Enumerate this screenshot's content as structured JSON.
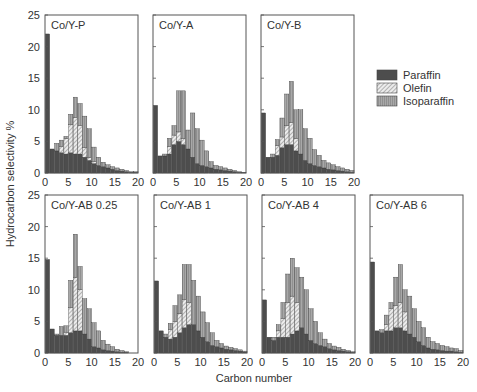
{
  "chart_data": {
    "type": "bar",
    "stacked": true,
    "ylabel": "Hydrocarbon selectivity %",
    "xlabel": "Carbon number",
    "ylim": [
      0,
      25
    ],
    "xlim": [
      0,
      20
    ],
    "yticks": [
      0,
      5,
      10,
      15,
      20,
      25
    ],
    "xticks": [
      0,
      5,
      10,
      15,
      20
    ],
    "legend": {
      "position": "right",
      "entries": [
        {
          "name": "Paraffin",
          "color": "#4d4d4d",
          "pattern": "solid"
        },
        {
          "name": "Olefin",
          "color": "#d6d6d6",
          "pattern": "hatched"
        },
        {
          "name": "Isoparaffin",
          "color": "#9a9a9a",
          "pattern": "vertical-lines"
        }
      ]
    },
    "categories": [
      1,
      2,
      3,
      4,
      5,
      6,
      7,
      8,
      9,
      10,
      11,
      12,
      13,
      14,
      15,
      16,
      17,
      18,
      19,
      20
    ],
    "panels": [
      {
        "title": "Co/Y-P",
        "series": [
          {
            "name": "Paraffin",
            "values": [
              22,
              3.8,
              3.5,
              3.2,
              3.0,
              3.2,
              3.0,
              3.0,
              2.5,
              2.0,
              1.5,
              1.2,
              1.0,
              0.8,
              0.6,
              0.4,
              0.3,
              0.2,
              0.1,
              0.1
            ]
          },
          {
            "name": "Olefin",
            "values": [
              0,
              0,
              0,
              1.0,
              2.5,
              4.5,
              5.8,
              4.5,
              1.5,
              0.5,
              0.3,
              0,
              0,
              0,
              0,
              0,
              0,
              0,
              0,
              0
            ]
          },
          {
            "name": "Isoparaffin",
            "values": [
              0,
              0,
              1.2,
              1.0,
              0.3,
              1.6,
              3.2,
              3.5,
              5.0,
              4.5,
              2.3,
              1.3,
              0.7,
              0.5,
              0.4,
              0.4,
              0.3,
              0.2,
              0.1,
              0.1
            ]
          }
        ],
        "totals": [
          22,
          3.8,
          4.7,
          5.2,
          5.8,
          9.3,
          12,
          11,
          9,
          7,
          4.1,
          2.5,
          1.7,
          1.3,
          1.0,
          0.8,
          0.6,
          0.4,
          0.2,
          0.2
        ]
      },
      {
        "title": "Co/Y-A",
        "series": [
          {
            "name": "Paraffin",
            "values": [
              10.7,
              2.7,
              2.7,
              3.0,
              4.5,
              5.0,
              4.5,
              3.8,
              2.5,
              1.5,
              1.2,
              1.0,
              0.8,
              0.6,
              0.5,
              0.4,
              0.3,
              0.2,
              0.1,
              0.1
            ]
          },
          {
            "name": "Olefin",
            "values": [
              0,
              0,
              0,
              1.2,
              1.5,
              1.5,
              1.0,
              0,
              0,
              0,
              0,
              0,
              0,
              0,
              0,
              0,
              0,
              0,
              0,
              0
            ]
          },
          {
            "name": "Isoparaffin",
            "values": [
              0,
              0,
              0.3,
              1.3,
              1.5,
              6.5,
              7.5,
              3.0,
              7.0,
              5.5,
              4.0,
              2.5,
              1.0,
              0.6,
              0.5,
              0.4,
              0.3,
              0.2,
              0.1,
              0
            ]
          }
        ],
        "totals": [
          10.7,
          2.7,
          3.0,
          5.5,
          7.5,
          13,
          13,
          7.0,
          9.5,
          7.0,
          5.2,
          3.5,
          1.8,
          1.2,
          1.0,
          0.8,
          0.6,
          0.4,
          0.2,
          0.1
        ]
      },
      {
        "title": "Co/Y-B",
        "series": [
          {
            "name": "Paraffin",
            "values": [
              9.5,
              2.5,
              2.5,
              2.8,
              4.0,
              4.5,
              4.5,
              3.5,
              3.0,
              2.0,
              1.5,
              1.2,
              1.0,
              0.8,
              0.6,
              0.5,
              0.4,
              0.3,
              0.2,
              0.1
            ]
          },
          {
            "name": "Olefin",
            "values": [
              0,
              0,
              0,
              1.5,
              1.7,
              3.0,
              3.5,
              2.0,
              0,
              0,
              0,
              0,
              0,
              0,
              0,
              0,
              0,
              0,
              0,
              0
            ]
          },
          {
            "name": "Isoparaffin",
            "values": [
              0,
              0,
              0.5,
              1.0,
              3.0,
              5.0,
              6.5,
              4.5,
              7.0,
              5.0,
              4.0,
              2.5,
              1.8,
              1.2,
              1.0,
              0.8,
              0.6,
              0.5,
              0.4,
              0.3
            ]
          }
        ],
        "totals": [
          9.5,
          2.5,
          3.0,
          5.3,
          8.7,
          12.5,
          14.5,
          10,
          10,
          7.0,
          5.5,
          3.7,
          2.8,
          2.0,
          1.6,
          1.3,
          1.0,
          0.8,
          0.6,
          0.4
        ]
      },
      {
        "title": "Co/Y-AB 0.25",
        "series": [
          {
            "name": "Paraffin",
            "values": [
              14.8,
              3.8,
              2.8,
              2.8,
              2.8,
              3.2,
              3.5,
              3.5,
              3.0,
              2.2,
              1.0,
              0.8,
              0.5,
              0.4,
              0.3,
              0.2,
              0.1,
              0.1,
              0,
              0
            ]
          },
          {
            "name": "Olefin",
            "values": [
              0,
              0,
              0,
              0,
              0.5,
              4.0,
              8.5,
              6.5,
              0,
              0,
              0,
              0,
              0,
              0,
              0,
              0,
              0,
              0,
              0,
              0
            ]
          },
          {
            "name": "Isoparaffin",
            "values": [
              0,
              0,
              0.2,
              1.4,
              1.0,
              4.3,
              6.8,
              3.7,
              5.6,
              4.8,
              3.8,
              2.7,
              1.5,
              1.0,
              0.7,
              0.4,
              0.3,
              0.1,
              0,
              0
            ]
          }
        ],
        "totals": [
          14.8,
          3.8,
          3.0,
          4.2,
          4.3,
          11.5,
          18.8,
          13.7,
          8.6,
          7.0,
          4.8,
          3.5,
          2.0,
          1.4,
          1.0,
          0.6,
          0.4,
          0.2,
          0,
          0
        ]
      },
      {
        "title": "Co/Y-AB 1",
        "series": [
          {
            "name": "Paraffin",
            "values": [
              11.4,
              3.5,
              2.5,
              2.2,
              2.5,
              3.2,
              4.0,
              4.5,
              4.5,
              3.5,
              2.5,
              1.8,
              1.2,
              1.0,
              0.8,
              0.6,
              0.5,
              0.4,
              0.3,
              0.2
            ]
          },
          {
            "name": "Olefin",
            "values": [
              0,
              0,
              0,
              1.5,
              2.5,
              3.0,
              4.5,
              3.5,
              0,
              0,
              0,
              0,
              0,
              0,
              0,
              0,
              0,
              0,
              0,
              0
            ]
          },
          {
            "name": "Isoparaffin",
            "values": [
              0,
              0,
              0.5,
              1.0,
              2.5,
              3.0,
              5.5,
              6.0,
              7.0,
              5.5,
              4.0,
              3.0,
              2.0,
              1.0,
              0.7,
              0.5,
              0.4,
              0.3,
              0.2,
              0.1
            ]
          }
        ],
        "totals": [
          11.4,
          3.5,
          3.0,
          4.7,
          7.5,
          9.2,
          14.0,
          14.0,
          11.5,
          9.0,
          6.5,
          4.8,
          3.2,
          2.0,
          1.5,
          1.1,
          0.9,
          0.7,
          0.5,
          0.3
        ]
      },
      {
        "title": "Co/Y-AB 4",
        "series": [
          {
            "name": "Paraffin",
            "values": [
              8.4,
              2.5,
              2.0,
              2.5,
              2.5,
              2.5,
              3.0,
              3.5,
              4.0,
              3.0,
              2.0,
              1.5,
              1.2,
              1.0,
              0.7,
              0.5,
              0.4,
              0.3,
              0.2,
              0.1
            ]
          },
          {
            "name": "Olefin",
            "values": [
              0,
              0,
              0,
              1.0,
              3.0,
              5.5,
              6.0,
              4.5,
              0,
              0,
              0,
              0,
              0,
              0,
              0,
              0,
              0,
              0,
              0,
              0
            ]
          },
          {
            "name": "Isoparaffin",
            "values": [
              0,
              0,
              0.5,
              1.0,
              2.5,
              4.5,
              6.0,
              5.5,
              8.0,
              7.0,
              5.0,
              3.5,
              2.0,
              1.2,
              0.8,
              0.6,
              0.5,
              0.3,
              0.2,
              0.1
            ]
          }
        ],
        "totals": [
          8.4,
          2.5,
          2.5,
          4.5,
          8.0,
          12.5,
          15.0,
          13.5,
          12.0,
          10.0,
          7.0,
          5.0,
          3.2,
          2.2,
          1.5,
          1.1,
          0.9,
          0.6,
          0.4,
          0.2
        ]
      },
      {
        "title": "Co/Y-AB 6",
        "series": [
          {
            "name": "Paraffin",
            "values": [
              14.4,
              3.5,
              3.2,
              3.5,
              3.5,
              4.0,
              4.0,
              3.5,
              3.0,
              2.5,
              1.8,
              1.2,
              0.8,
              0.6,
              0.5,
              0.4,
              0.3,
              0.3,
              0.2,
              0.1
            ]
          },
          {
            "name": "Olefin",
            "values": [
              0,
              0,
              0,
              1.0,
              3.5,
              3.5,
              4.0,
              3.0,
              0,
              0,
              0,
              0,
              0,
              0,
              0,
              0,
              0,
              0,
              0,
              0
            ]
          },
          {
            "name": "Isoparaffin",
            "values": [
              0,
              0,
              0.5,
              1.5,
              1.0,
              4.5,
              6.0,
              3.5,
              6.0,
              4.5,
              3.2,
              2.8,
              1.7,
              1.2,
              1.0,
              0.8,
              0.7,
              0.5,
              0.5,
              0.3
            ]
          }
        ],
        "totals": [
          14.4,
          3.5,
          3.7,
          6.0,
          8.0,
          12.0,
          14.0,
          10.0,
          9.0,
          7.0,
          5.0,
          4.0,
          2.5,
          1.8,
          1.5,
          1.2,
          1.0,
          0.8,
          0.7,
          0.4
        ]
      }
    ]
  }
}
